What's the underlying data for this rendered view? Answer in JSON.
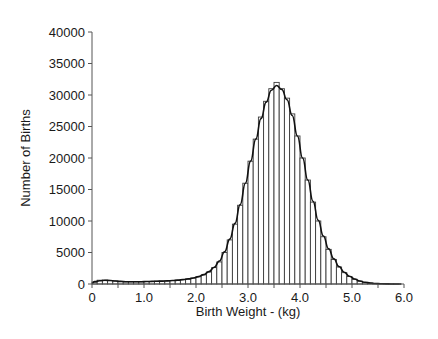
{
  "chart_data": {
    "type": "bar",
    "title": "",
    "xlabel": "Birth Weight - (kg)",
    "ylabel": "Number of Births",
    "xlim": [
      0,
      6.0
    ],
    "ylim": [
      0,
      40000
    ],
    "x_ticks": [
      "0",
      "1.0",
      "2.0",
      "3.0",
      "4.0",
      "5.0",
      "6.0"
    ],
    "y_ticks": [
      "0",
      "5000",
      "10000",
      "15000",
      "20000",
      "25000",
      "30000",
      "35000",
      "40000"
    ],
    "grid": false,
    "legend": null,
    "bin_width_kg": 0.1,
    "bin_starts": [
      0.0,
      0.1,
      0.2,
      0.3,
      0.4,
      0.5,
      0.6,
      0.7,
      0.8,
      0.9,
      1.0,
      1.1,
      1.2,
      1.3,
      1.4,
      1.5,
      1.6,
      1.7,
      1.8,
      1.9,
      2.0,
      2.1,
      2.2,
      2.3,
      2.4,
      2.5,
      2.6,
      2.7,
      2.8,
      2.9,
      3.0,
      3.1,
      3.2,
      3.3,
      3.4,
      3.5,
      3.6,
      3.7,
      3.8,
      3.9,
      4.0,
      4.1,
      4.2,
      4.3,
      4.4,
      4.5,
      4.6,
      4.7,
      4.8,
      4.9,
      5.0,
      5.1,
      5.2,
      5.3,
      5.4,
      5.5,
      5.6,
      5.7,
      5.8,
      5.9
    ],
    "values": [
      300,
      600,
      600,
      550,
      500,
      400,
      350,
      350,
      350,
      350,
      400,
      400,
      450,
      450,
      500,
      550,
      600,
      700,
      800,
      950,
      1150,
      1450,
      1900,
      2600,
      3500,
      5000,
      7000,
      9500,
      12500,
      16000,
      19500,
      23000,
      26500,
      29000,
      31000,
      32000,
      31000,
      29500,
      27000,
      23500,
      20000,
      16500,
      13000,
      10000,
      7500,
      5500,
      3900,
      2700,
      1800,
      1200,
      750,
      450,
      250,
      150,
      80,
      40,
      20,
      10,
      5,
      0
    ],
    "series": [
      {
        "name": "Histogram (observed births)",
        "style": "bars"
      },
      {
        "name": "Fitted curve",
        "style": "smooth-line"
      }
    ],
    "fitted_curve": {
      "description": "smooth curve overlaid on histogram, peaking near 3.55 kg at ~31000",
      "peak_x": 3.55,
      "peak_y": 31000
    }
  },
  "labels": {
    "xlabel": "Birth Weight - (kg)",
    "ylabel": "Number of Births"
  },
  "colors": {
    "bar_fill": "#ffffff",
    "bar_stroke": "#3a3a3a",
    "curve": "#111111",
    "axis": "#555555",
    "text": "#1a1a1a"
  }
}
